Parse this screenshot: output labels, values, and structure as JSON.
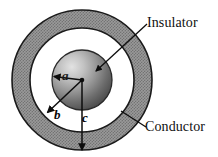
{
  "figure": {
    "background_color": "#ffffff",
    "width": 218,
    "height": 157
  },
  "geometry": {
    "center_x": 82,
    "center_y": 80,
    "inner_sphere_radius": 30,
    "insulator_outer_radius": 52,
    "conductor_outer_radius": 70,
    "conductor_fill": "#8a8a8a",
    "insulator_fill": "#ffffff",
    "sphere_light": "#d8d8d8",
    "sphere_dark": "#4a4a4a",
    "outline_color": "#1a1a1a"
  },
  "callouts": [
    {
      "id": "insulator",
      "label": "Insulator",
      "leader_from_x": 148,
      "leader_from_y": 24,
      "leader_to_x": 96,
      "leader_to_y": 71
    },
    {
      "id": "conductor",
      "label": "Conductor",
      "leader_from_x": 146,
      "leader_from_y": 126,
      "leader_to_x": 122,
      "leader_to_y": 112
    }
  ],
  "radii": [
    {
      "id": "a",
      "label": "a",
      "description": "inner conductor sphere radius",
      "arrow_from_x": 82,
      "arrow_from_y": 80,
      "arrow_to_x": 53,
      "arrow_to_y": 76
    },
    {
      "id": "b",
      "label": "b",
      "description": "inner radius of outer conductor shell",
      "arrow_from_x": 82,
      "arrow_from_y": 80,
      "arrow_to_x": 47,
      "arrow_to_y": 113
    },
    {
      "id": "c",
      "label": "c",
      "description": "outer radius of outer conductor shell",
      "arrow_from_x": 82,
      "arrow_from_y": 80,
      "arrow_to_x": 82,
      "arrow_to_y": 150
    }
  ]
}
